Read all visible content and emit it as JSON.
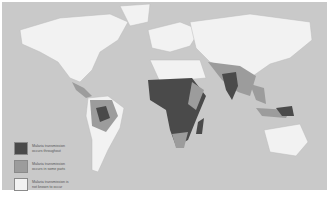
{
  "map": {
    "title": "",
    "legend": [
      {
        "label": "Malaria transmission occurs throughout",
        "color": "#4a4a4a"
      },
      {
        "label": "Malaria transmission occurs in some parts",
        "color": "#9c9c9c"
      },
      {
        "label": "Malaria transmission is not known to occur",
        "color": "#f2f2f2"
      }
    ],
    "colors": {
      "ocean": "#c9c9c9",
      "land_none": "#f2f2f2",
      "land_some": "#9c9c9c",
      "land_all": "#4a4a4a"
    }
  }
}
